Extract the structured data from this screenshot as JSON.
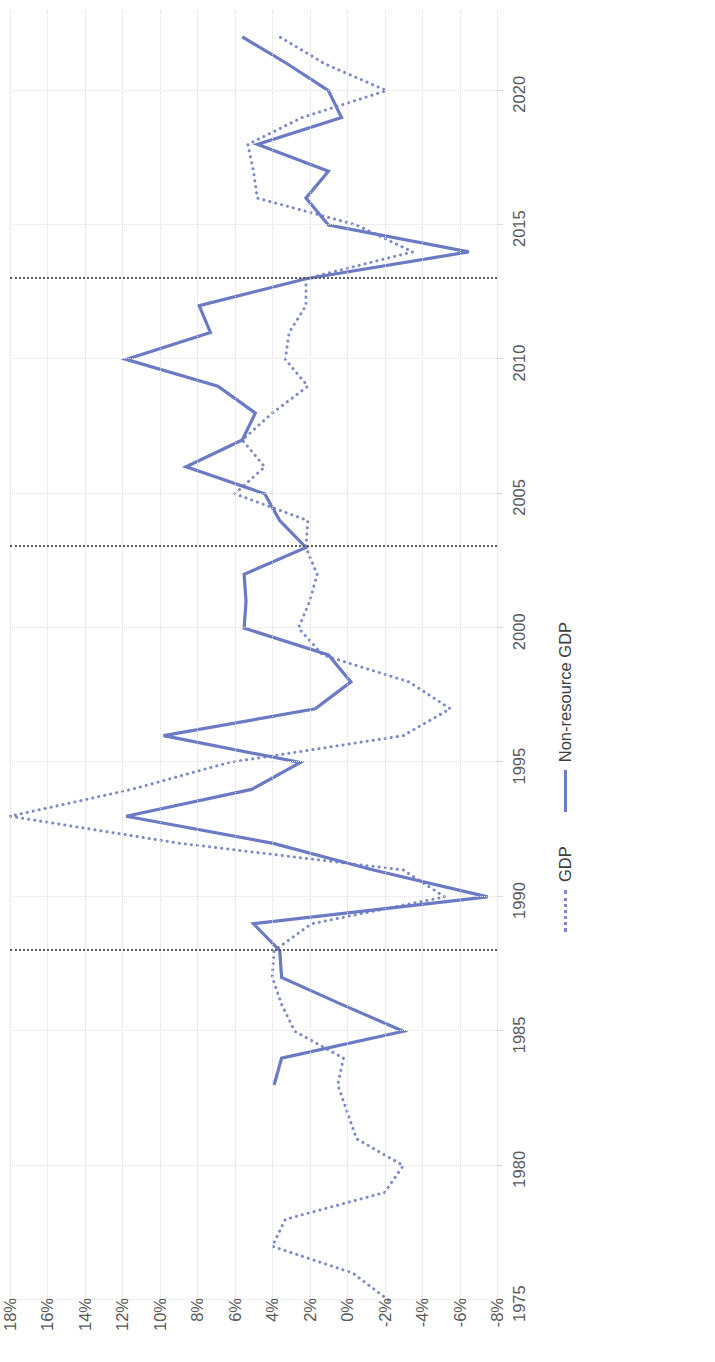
{
  "chart_data": {
    "type": "line",
    "title": "",
    "subtitle": "",
    "xlabel": "",
    "ylabel": "",
    "orientation": "rotated-90-ccw",
    "grid": true,
    "legend_position": "bottom",
    "xlim": [
      1975,
      2023
    ],
    "ylim": [
      -8,
      18
    ],
    "x_ticks": [
      1975,
      1980,
      1985,
      1990,
      1995,
      2000,
      2005,
      2010,
      2015,
      2020
    ],
    "y_ticks": [
      18,
      16,
      14,
      12,
      10,
      8,
      6,
      4,
      2,
      0,
      -2,
      -4,
      -6,
      -8
    ],
    "y_tick_labels": [
      "18%",
      "16%",
      "14%",
      "12%",
      "10%",
      "8%",
      "6%",
      "4%",
      "2%",
      "0%",
      "-2%",
      "-4%",
      "-6%",
      "-8%"
    ],
    "reference_lines": [
      {
        "x": 1988,
        "style": "dotted",
        "color": "#5a5a5a"
      },
      {
        "x": 2003,
        "style": "dotted",
        "color": "#5a5a5a"
      },
      {
        "x": 2013,
        "style": "dotted",
        "color": "#5a5a5a"
      }
    ],
    "x": [
      1975,
      1976,
      1977,
      1978,
      1979,
      1980,
      1981,
      1982,
      1983,
      1984,
      1985,
      1986,
      1987,
      1988,
      1989,
      1990,
      1991,
      1992,
      1993,
      1994,
      1995,
      1996,
      1997,
      1998,
      1999,
      2000,
      2001,
      2002,
      2003,
      2004,
      2005,
      2006,
      2007,
      2008,
      2009,
      2010,
      2011,
      2012,
      2013,
      2014,
      2015,
      2016,
      2017,
      2018,
      2019,
      2020,
      2021,
      2022
    ],
    "series": [
      {
        "name": "GDP",
        "style": "dotted",
        "color": "#7b88c9",
        "values": [
          -2.2,
          -0.3,
          4.0,
          3.3,
          -2.0,
          -3.0,
          -0.5,
          0.0,
          0.5,
          0.2,
          2.8,
          3.5,
          4.0,
          3.9,
          1.9,
          -5.2,
          -3.0,
          9.0,
          18.0,
          11.5,
          6.3,
          -3.0,
          -5.5,
          -3.3,
          1.3,
          2.6,
          2.0,
          1.6,
          2.2,
          2.1,
          6.0,
          4.4,
          5.6,
          4.0,
          2.1,
          3.3,
          3.1,
          2.2,
          2.2,
          -3.5,
          -0.5,
          4.8,
          5.0,
          5.3,
          2.4,
          -2.1,
          1.2,
          3.6
        ]
      },
      {
        "name": "Non-resource GDP",
        "style": "solid",
        "color": "#6b7ac4",
        "values": [
          null,
          null,
          null,
          null,
          null,
          null,
          null,
          null,
          3.9,
          3.5,
          -3.0,
          0.3,
          3.5,
          3.6,
          5.0,
          -7.5,
          -1.4,
          4.0,
          11.8,
          5.1,
          2.5,
          9.8,
          1.7,
          -0.2,
          1.0,
          5.5,
          5.4,
          5.5,
          2.2,
          3.6,
          4.4,
          8.6,
          5.6,
          4.9,
          6.9,
          11.8,
          7.3,
          7.9,
          2.2,
          -6.5,
          1.0,
          2.2,
          1.0,
          4.8,
          0.3,
          1.0,
          3.2,
          5.6
        ]
      }
    ]
  },
  "legend": {
    "items": [
      {
        "label": "GDP",
        "style": "dotted"
      },
      {
        "label": "Non-resource GDP",
        "style": "solid"
      }
    ]
  }
}
